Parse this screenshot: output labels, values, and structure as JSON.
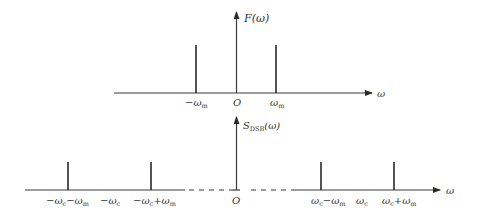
{
  "top_plot": {
    "y_label": "F(ω)",
    "x_label": "ω",
    "origin_label": "O",
    "impulses": [
      {
        "label_main": "−ω",
        "label_sub": "m"
      },
      {
        "label_main": "ω",
        "label_sub": "m"
      }
    ]
  },
  "bottom_plot": {
    "y_label_main": "S",
    "y_label_sub": "DSB",
    "y_label_tail": "(ω)",
    "x_label": "ω",
    "origin_label": "O",
    "ticks": [
      {
        "a": "−ω",
        "a_sub": "c",
        "b": "−ω",
        "b_sub": "m"
      },
      {
        "a": "−ω",
        "a_sub": "c"
      },
      {
        "a": "−ω",
        "a_sub": "c",
        "b": "+ω",
        "b_sub": "m"
      },
      {
        "a": "ω",
        "a_sub": "c",
        "b": "−ω",
        "b_sub": "m"
      },
      {
        "a": "ω",
        "a_sub": "c"
      },
      {
        "a": "ω",
        "a_sub": "c",
        "b": "+ω",
        "b_sub": "m"
      }
    ]
  }
}
